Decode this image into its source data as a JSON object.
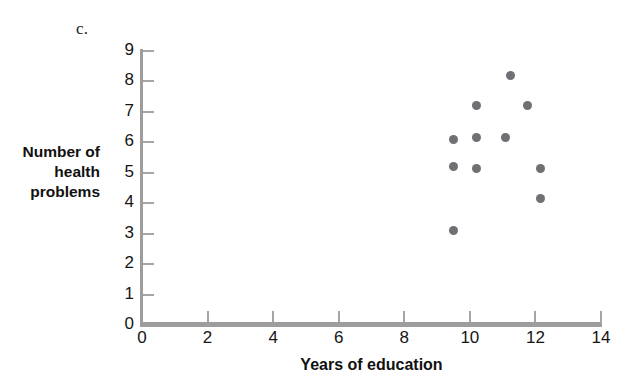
{
  "panel": {
    "letter": "c."
  },
  "chart_data": {
    "type": "scatter",
    "title": "",
    "panel_label": "c.",
    "xlabel": "Years of education",
    "ylabel": "Number of health problems",
    "ylabel_lines": [
      "Number of",
      "health",
      "problems"
    ],
    "xlim": [
      0,
      14
    ],
    "ylim": [
      0,
      9
    ],
    "xticks": [
      0,
      2,
      4,
      6,
      8,
      10,
      12,
      14
    ],
    "xtick_labels": [
      "0",
      "2",
      "4",
      "6",
      "8",
      "10",
      "12",
      "14"
    ],
    "yticks": [
      0,
      1,
      2,
      3,
      4,
      5,
      6,
      7,
      8,
      9
    ],
    "ytick_labels": [
      "0",
      "1",
      "2",
      "3",
      "4",
      "5",
      "6",
      "7",
      "8",
      "9"
    ],
    "grid": false,
    "legend": null,
    "series": [
      {
        "name": "observations",
        "color": "#6f6f74",
        "marker": "circle",
        "points": [
          {
            "x": 9.5,
            "y": 6.1
          },
          {
            "x": 9.5,
            "y": 5.2
          },
          {
            "x": 9.5,
            "y": 3.1
          },
          {
            "x": 10.2,
            "y": 7.2
          },
          {
            "x": 10.2,
            "y": 6.15
          },
          {
            "x": 10.2,
            "y": 5.15
          },
          {
            "x": 11.1,
            "y": 6.15
          },
          {
            "x": 11.25,
            "y": 8.2
          },
          {
            "x": 11.75,
            "y": 7.2
          },
          {
            "x": 12.15,
            "y": 5.15
          },
          {
            "x": 12.15,
            "y": 4.15
          }
        ]
      }
    ],
    "n_points": 11,
    "axis_color": "#9d9d9d",
    "point_color": "#6f6f74"
  }
}
